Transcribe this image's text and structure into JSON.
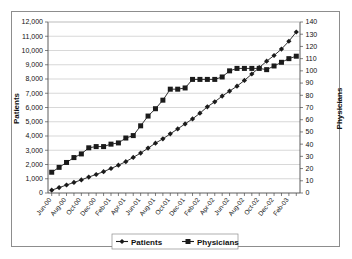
{
  "chart_data": {
    "type": "line",
    "title": "",
    "subtitle": "",
    "xlabel": "",
    "ylabel": "Patients",
    "y2label": "Physicians",
    "ylim": [
      0,
      12000
    ],
    "y2lim": [
      0,
      140
    ],
    "ytick_step": 1000,
    "y2tick_step": 10,
    "grid": true,
    "legend_position": "bottom",
    "x": [
      "Jun-00",
      "Jul-00",
      "Aug-00",
      "Sep-00",
      "Oct-00",
      "Nov-00",
      "Dec-00",
      "Jan-01",
      "Feb-01",
      "Mar-01",
      "Apr-01",
      "May-01",
      "Jun-01",
      "Jul-01",
      "Aug-01",
      "Sep-01",
      "Oct-01",
      "Nov-01",
      "Dec-01",
      "Jan-02",
      "Feb-02",
      "Mar-02",
      "Apr-02",
      "May-02",
      "Jun-02",
      "Jul-02",
      "Aug-02",
      "Sep-02",
      "Oct-02",
      "Nov-02",
      "Dec-02",
      "Jan-03",
      "Feb-03",
      "Mar-03"
    ],
    "xtick_labels": [
      "Jun-00",
      "Aug-00",
      "Oct-00",
      "Dec-00",
      "Feb-01",
      "Apr-01",
      "Jun-01",
      "Aug-01",
      "Oct-01",
      "Dec-01",
      "Feb-02",
      "Apr-02",
      "Jun-02",
      "Aug-02",
      "Oct-02",
      "Dec-02",
      "Feb-03"
    ],
    "ytick_labels": [
      "0",
      "1,000",
      "2,000",
      "3,000",
      "4,000",
      "5,000",
      "6,000",
      "7,000",
      "8,000",
      "9,000",
      "10,000",
      "11,000",
      "12,000"
    ],
    "y2tick_labels": [
      "0",
      "10",
      "20",
      "30",
      "40",
      "50",
      "60",
      "70",
      "80",
      "90",
      "100",
      "110",
      "120",
      "130",
      "140"
    ],
    "series": [
      {
        "name": "Patients",
        "axis": "left",
        "marker": "diamond",
        "color": "#1b1b1b",
        "values": [
          200,
          380,
          560,
          740,
          920,
          1120,
          1300,
          1500,
          1720,
          1950,
          2200,
          2500,
          2800,
          3150,
          3500,
          3800,
          4150,
          4500,
          4850,
          5200,
          5600,
          6050,
          6400,
          6800,
          7150,
          7500,
          7900,
          8350,
          8800,
          9250,
          9650,
          10100,
          10650,
          11300
        ]
      },
      {
        "name": "Physicians",
        "axis": "right",
        "marker": "square",
        "color": "#1b1b1b",
        "values": [
          17,
          21,
          25,
          29,
          32,
          37,
          38,
          38,
          40,
          41,
          45,
          47,
          55,
          63,
          69,
          76,
          85,
          85,
          86,
          93,
          93,
          93,
          93,
          95,
          100,
          102,
          102,
          102,
          102,
          101,
          104,
          107,
          110,
          112
        ]
      }
    ]
  },
  "legend": {
    "items": [
      {
        "label": "Patients",
        "marker": "diamond"
      },
      {
        "label": "Physicians",
        "marker": "square"
      }
    ]
  }
}
